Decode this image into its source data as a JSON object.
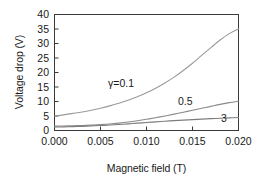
{
  "chart_data": {
    "type": "line",
    "title": "",
    "xlabel": "Magnetic field (T)",
    "ylabel": "Voltage drop (V)",
    "xlim": [
      0.0,
      0.02
    ],
    "ylim": [
      0,
      40
    ],
    "grid": false,
    "legend_position": "inline-annotations",
    "xticks": [
      0.0,
      0.005,
      0.01,
      0.015,
      0.02
    ],
    "xtick_labels": [
      "0.000",
      "0.005",
      "0.010",
      "0.015",
      "0.020"
    ],
    "yticks": [
      0,
      5,
      10,
      15,
      20,
      25,
      30,
      35,
      40
    ],
    "ytick_labels": [
      "0",
      "5",
      "10",
      "15",
      "20",
      "25",
      "30",
      "35",
      "40"
    ],
    "x": [
      0.0,
      0.001,
      0.002,
      0.003,
      0.004,
      0.005,
      0.006,
      0.007,
      0.008,
      0.009,
      0.01,
      0.011,
      0.012,
      0.013,
      0.014,
      0.015,
      0.016,
      0.017,
      0.018,
      0.019,
      0.02
    ],
    "series": [
      {
        "name": "gamma=0.1",
        "label": "γ=0.1",
        "color": "#9a9a9a",
        "values": [
          5.0,
          5.4,
          5.9,
          6.4,
          7.0,
          7.7,
          8.5,
          9.4,
          10.4,
          11.6,
          13.0,
          14.6,
          16.4,
          18.4,
          20.7,
          23.2,
          25.9,
          28.6,
          31.2,
          33.4,
          35.0
        ]
      },
      {
        "name": "gamma=0.5",
        "label": "0.5",
        "color": "#8a8a8a",
        "values": [
          1.5,
          1.55,
          1.62,
          1.72,
          1.85,
          2.02,
          2.25,
          2.55,
          2.92,
          3.36,
          3.86,
          4.42,
          5.02,
          5.65,
          6.3,
          6.97,
          7.65,
          8.33,
          9.0,
          9.6,
          10.1
        ]
      },
      {
        "name": "gamma=3",
        "label": "3",
        "color": "#7d7d7d",
        "values": [
          1.2,
          1.25,
          1.32,
          1.42,
          1.55,
          1.7,
          1.88,
          2.08,
          2.3,
          2.53,
          2.76,
          2.99,
          3.2,
          3.4,
          3.59,
          3.76,
          3.92,
          4.08,
          4.22,
          4.36,
          4.5
        ]
      }
    ],
    "annotations": [
      {
        "text": "γ=0.1",
        "x_px": 108,
        "y_px": 78
      },
      {
        "text": "0.5",
        "x_px": 178,
        "y_px": 96
      },
      {
        "text": "3",
        "x_px": 221,
        "y_px": 113
      }
    ]
  },
  "axes": {
    "frame_color": "#3a3a3a",
    "background": "#ffffff"
  }
}
